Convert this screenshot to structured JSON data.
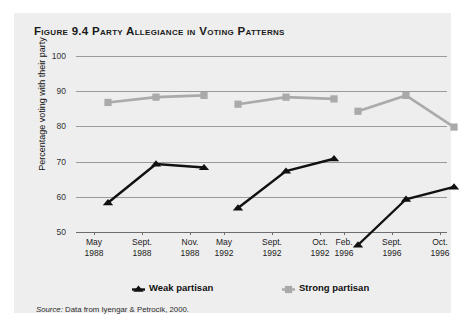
{
  "figure": {
    "label": "Figure 9.4",
    "title": "Party Allegiance in Voting Patterns",
    "source_prefix": "Source:",
    "source_text": " Data from Iyengar & Petrocik, 2000."
  },
  "colors": {
    "panel_background": "#eeeeee",
    "page_background": "#ffffff",
    "weak_partisan": "#111111",
    "strong_partisan": "#aaaaaa",
    "gridline": "#9a9a9a",
    "axis": "#6d6d6d"
  },
  "chart_data": {
    "type": "line",
    "title": "Party Allegiance in Voting Patterns",
    "xlabel": "",
    "ylabel": "Percentage voting with their party",
    "ylim": [
      50,
      100
    ],
    "yticks": [
      50,
      60,
      70,
      80,
      90,
      100
    ],
    "ytick_labels": [
      "50",
      "60",
      "70",
      "80",
      "90",
      "100"
    ],
    "grid": true,
    "legend_position": "bottom",
    "groups": [
      "1988",
      "1992",
      "1996"
    ],
    "categories": [
      {
        "month": "May",
        "year": "1988",
        "group": "1988"
      },
      {
        "month": "Sept.",
        "year": "1988",
        "group": "1988"
      },
      {
        "month": "Nov.",
        "year": "1988",
        "group": "1988"
      },
      {
        "month": "May",
        "year": "1992",
        "group": "1992"
      },
      {
        "month": "Sept.",
        "year": "1992",
        "group": "1992"
      },
      {
        "month": "Oct.",
        "year": "1992",
        "group": "1992"
      },
      {
        "month": "Feb.",
        "year": "1996",
        "group": "1996"
      },
      {
        "month": "Sept.",
        "year": "1996",
        "group": "1996"
      },
      {
        "month": "Oct.",
        "year": "1996",
        "group": "1996"
      }
    ],
    "series": [
      {
        "name": "Weak partisan",
        "marker": "triangle",
        "color": "#111111",
        "values": [
          62,
          73,
          72,
          60.5,
          71,
          74.5,
          50,
          63,
          66.5
        ]
      },
      {
        "name": "Strong partisan",
        "marker": "square",
        "color": "#aaaaaa",
        "values": [
          90.5,
          92,
          92.5,
          90,
          92,
          91.5,
          88,
          92.5,
          83.5
        ]
      }
    ]
  },
  "legend": {
    "items": [
      {
        "label": "Weak partisan",
        "marker": "triangle",
        "color": "#111111"
      },
      {
        "label": "Strong partisan",
        "marker": "square",
        "color": "#aaaaaa"
      }
    ]
  }
}
